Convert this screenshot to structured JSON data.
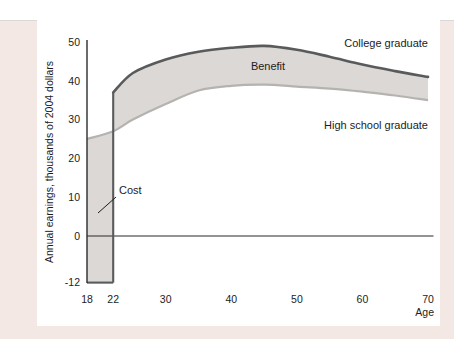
{
  "figure": {
    "y_axis_title": "Annual earnings, thousands of 2004 dollars",
    "x_axis_title": "Age",
    "labels": {
      "college": "College graduate",
      "high_school": "High school graduate",
      "benefit": "Benefit",
      "cost": "Cost"
    }
  },
  "colors": {
    "band_fill": "#dbd8d5",
    "college_line": "#595a5c",
    "hs_line": "#b5b3b0",
    "axis": "#2a2b2d",
    "panel_bg": "#f4e8e5",
    "figure_bg": "#ffffff"
  },
  "chart_data": {
    "type": "area",
    "title": "",
    "xlabel": "Age",
    "ylabel": "Annual earnings, thousands of 2004 dollars",
    "xlim": [
      18,
      70
    ],
    "ylim": [
      -12,
      50
    ],
    "x_ticks": [
      18,
      22,
      30,
      40,
      50,
      60,
      70
    ],
    "y_ticks": [
      50,
      40,
      30,
      20,
      10,
      0,
      -12
    ],
    "grid": false,
    "legend_position": "labels-on-chart",
    "series": [
      {
        "name": "College graduate",
        "x": [
          22,
          25,
          30,
          35,
          40,
          45,
          50,
          55,
          60,
          65,
          70
        ],
        "values": [
          37,
          42,
          45.5,
          47.5,
          48.5,
          49,
          48,
          46.2,
          44.2,
          42.5,
          41
        ]
      },
      {
        "name": "High school graduate",
        "x": [
          18,
          22,
          25,
          30,
          35,
          40,
          45,
          50,
          55,
          60,
          65,
          70
        ],
        "values": [
          25,
          27,
          30,
          34,
          37.5,
          38.7,
          39,
          38.5,
          38,
          37.2,
          36.2,
          35
        ]
      }
    ],
    "regions": [
      {
        "name": "Benefit",
        "description": "Shaded band between college-graduate and high-school-graduate earnings, ages 22 to 70"
      },
      {
        "name": "Cost",
        "description": "Shaded bar from ages 18 to 22, spanning -12 up to high-school earnings"
      }
    ],
    "cost_floor": -12
  }
}
